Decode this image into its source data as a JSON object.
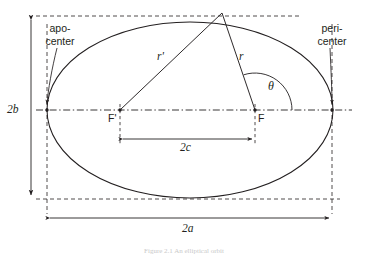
{
  "figure": {
    "title_caption": "Figure 2.1  An elliptical orbit",
    "labels": {
      "apocenter": "apo-\ncenter",
      "apocenter_line1": "apo-",
      "apocenter_line2": "center",
      "pericenter_line1": "peri-",
      "pericenter_line2": "center",
      "focus_left": "F'",
      "focus_right": "F",
      "radius_left": "r'",
      "radius_right": "r",
      "angle": "θ",
      "semi_minor_dim": "2b",
      "focal_dim": "2c",
      "semi_major_dim": "2a"
    },
    "colors": {
      "stroke": "#231f20",
      "dashed": "#231f20",
      "background": "#ffffff",
      "caption": "#c9c9c9"
    },
    "geometry": {
      "ellipse_center_x": 190,
      "ellipse_center_y": 110,
      "semi_major_a": 143,
      "semi_minor_b": 88,
      "focus_left_x": 120,
      "focus_right_x": 255,
      "focal_half_c": 67,
      "apex_x": 222,
      "apex_y": 13,
      "apocenter_x": 47,
      "apocenter_y": 110,
      "pericenter_x": 332,
      "pericenter_y": 110,
      "angle_theta_deg": 58
    }
  }
}
